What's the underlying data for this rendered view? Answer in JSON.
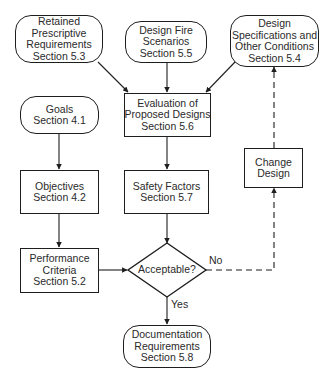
{
  "diagram": {
    "type": "flowchart",
    "nodes": {
      "retained": {
        "shape": "rounded",
        "lines": [
          "Retained",
          "Prescriptive",
          "Requirements",
          "Section 5.3"
        ]
      },
      "fire_scenarios": {
        "shape": "rounded",
        "lines": [
          "Design Fire",
          "Scenarios",
          "Section 5.5"
        ]
      },
      "design_specs": {
        "shape": "rounded",
        "lines": [
          "Design",
          "Specifications and",
          "Other Conditions",
          "Section 5.4"
        ]
      },
      "goals": {
        "shape": "rounded",
        "lines": [
          "Goals",
          "Section 4.1"
        ]
      },
      "evaluation": {
        "shape": "rect",
        "lines": [
          "Evaluation of",
          "Proposed Designs",
          "Section 5.6"
        ]
      },
      "change_design": {
        "shape": "rect",
        "lines": [
          "Change",
          "Design"
        ]
      },
      "objectives": {
        "shape": "rect",
        "lines": [
          "Objectives",
          "Section 4.2"
        ]
      },
      "safety_factors": {
        "shape": "rect",
        "lines": [
          "Safety Factors",
          "Section 5.7"
        ]
      },
      "performance": {
        "shape": "rect",
        "lines": [
          "Performance",
          "Criteria",
          "Section 5.2"
        ]
      },
      "acceptable": {
        "shape": "diamond",
        "label": "Acceptable?"
      },
      "documentation": {
        "shape": "rounded",
        "lines": [
          "Documentation",
          "Requirements",
          "Section 5.8"
        ]
      }
    },
    "edges": [
      {
        "from": "retained",
        "to": "evaluation",
        "style": "solid"
      },
      {
        "from": "fire_scenarios",
        "to": "evaluation",
        "style": "solid"
      },
      {
        "from": "design_specs",
        "to": "evaluation",
        "style": "solid"
      },
      {
        "from": "evaluation",
        "to": "safety_factors",
        "style": "solid"
      },
      {
        "from": "safety_factors",
        "to": "acceptable",
        "style": "solid"
      },
      {
        "from": "goals",
        "to": "objectives",
        "style": "solid"
      },
      {
        "from": "objectives",
        "to": "performance",
        "style": "solid"
      },
      {
        "from": "performance",
        "to": "acceptable",
        "style": "solid"
      },
      {
        "from": "acceptable",
        "to": "change_design",
        "style": "dashed",
        "label": "No"
      },
      {
        "from": "change_design",
        "to": "design_specs",
        "style": "dashed"
      },
      {
        "from": "acceptable",
        "to": "documentation",
        "style": "solid",
        "label": "Yes"
      }
    ],
    "edge_labels": {
      "no": "No",
      "yes": "Yes"
    },
    "colors": {
      "stroke": "#1e1e1e",
      "text": "#2a2a2a",
      "background": "#ffffff"
    }
  }
}
